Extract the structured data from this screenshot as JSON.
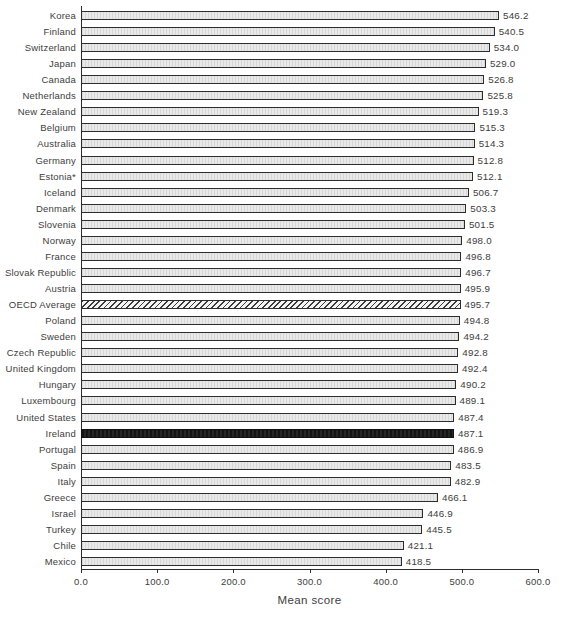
{
  "chart_data": {
    "type": "bar",
    "orientation": "horizontal",
    "title": "",
    "xlabel": "Mean score",
    "ylabel": "",
    "xlim": [
      0,
      600
    ],
    "x_ticks": [
      "0.0",
      "100.0",
      "200.0",
      "300.0",
      "400.0",
      "500.0",
      "600.0"
    ],
    "x_tick_values": [
      0,
      100,
      200,
      300,
      400,
      500,
      600
    ],
    "grid": "off",
    "legend": "none",
    "categories": [
      "Korea",
      "Finland",
      "Switzerland",
      "Japan",
      "Canada",
      "Netherlands",
      "New Zealand",
      "Belgium",
      "Australia",
      "Germany",
      "Estonia*",
      "Iceland",
      "Denmark",
      "Slovenia",
      "Norway",
      "France",
      "Slovak Republic",
      "Austria",
      "OECD Average",
      "Poland",
      "Sweden",
      "Czech Republic",
      "United Kingdom",
      "Hungary",
      "Luxembourg",
      "United States",
      "Ireland",
      "Portugal",
      "Spain",
      "Italy",
      "Greece",
      "Israel",
      "Turkey",
      "Chile",
      "Mexico"
    ],
    "values": [
      546.2,
      540.5,
      534.0,
      529.0,
      526.8,
      525.8,
      519.3,
      515.3,
      514.3,
      512.8,
      512.1,
      506.7,
      503.3,
      501.5,
      498.0,
      496.8,
      496.7,
      495.9,
      495.7,
      494.8,
      494.2,
      492.8,
      492.4,
      490.2,
      489.1,
      487.4,
      487.1,
      486.9,
      483.5,
      482.9,
      466.1,
      446.9,
      445.5,
      421.1,
      418.5
    ],
    "bar_styles": [
      "default",
      "default",
      "default",
      "default",
      "default",
      "default",
      "default",
      "default",
      "default",
      "default",
      "default",
      "default",
      "default",
      "default",
      "default",
      "default",
      "default",
      "default",
      "hatched",
      "default",
      "default",
      "default",
      "default",
      "default",
      "default",
      "default",
      "dark",
      "default",
      "default",
      "default",
      "default",
      "default",
      "default",
      "default",
      "default"
    ],
    "value_label_format": "one_decimal"
  },
  "colors": {
    "bar_fill": "#e9e9e9",
    "bar_texture": "#d7d7d7",
    "bar_border": "#2d2d2d",
    "highlight_dark": "#1c1c1c",
    "hatch_stroke": "#3a3a3a",
    "axis": "#2d2d2d",
    "text": "#3d3d3d",
    "background": "#ffffff"
  }
}
